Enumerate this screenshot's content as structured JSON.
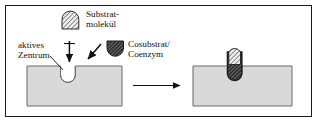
{
  "figure": {
    "kind": "diagram",
    "language": "de",
    "border_color": "#1a1a1a",
    "background": "#ffffff"
  },
  "labels": {
    "substrate": {
      "line1": "Substrat-",
      "line2": "molekül",
      "name": "Substratmolekül"
    },
    "cosubstrate": {
      "line1": "Cosubstrat/",
      "line2": "Coenzym",
      "name": "Cosubstrat/Coenzym"
    },
    "active_site": {
      "line1": "aktives",
      "line2": "Zentrum",
      "name": "aktives Zentrum"
    }
  },
  "shapes": {
    "enzyme_block": {
      "fill": "#d9d9d9",
      "stroke": "#555555"
    },
    "substrate_icon": {
      "fill": "#e8e8e8",
      "stroke": "#333333",
      "hatch": "diagonal-light"
    },
    "cosubstrate_icon": {
      "fill": "#3a3a3a",
      "stroke": "#1a1a1a",
      "hatch": "diagonal-dark"
    },
    "arrow_color": "#111111"
  },
  "panels": {
    "left": {
      "name": "enzyme-with-empty-active-site"
    },
    "right": {
      "name": "enzyme-substrate-complex"
    }
  }
}
